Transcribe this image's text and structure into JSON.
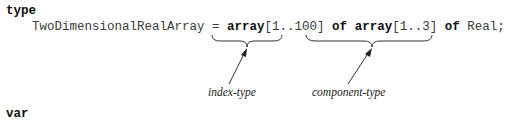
{
  "code": {
    "keyword_type": "type",
    "type_name": "TwoDimensionalRealArray",
    "equals": " = ",
    "array_kw_1": "array",
    "index_range_1": "[1..100]",
    "of_kw_1": "of",
    "array_kw_2": "array",
    "index_range_2": "[1..3]",
    "of_kw_2": "of",
    "element_type": "Real;",
    "keyword_var": "var"
  },
  "annotations": {
    "index_type_label": "index-type",
    "component_type_label": "component-type"
  }
}
